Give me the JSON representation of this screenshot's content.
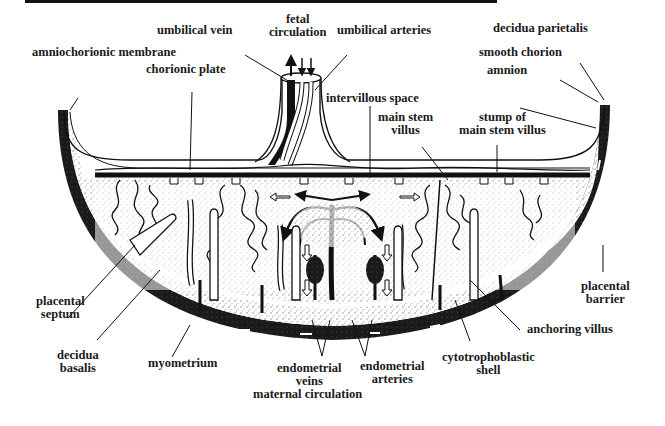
{
  "figure": {
    "colors": {
      "ink": "#111111",
      "background": "#ffffff",
      "stipple": "#8a8a8a"
    }
  },
  "labels": {
    "fetal_circulation": [
      "fetal",
      "circulation"
    ],
    "umbilical_vein": "umbilical vein",
    "umbilical_arteries": "umbilical arteries",
    "decidua_parietalis": "decidua parietalis",
    "amniochorionic_membrane": "amniochorionic membrane",
    "smooth_chorion": "smooth chorion",
    "chorionic_plate": "chorionic plate",
    "intervillous_space": "intervillous space",
    "amnion": "amnion",
    "main_stem_villus": [
      "main stem",
      "villus"
    ],
    "stump_of_main_stem_villus": [
      "stump of",
      "main stem villus"
    ],
    "placental_septum": [
      "placental",
      "septum"
    ],
    "placental_barrier": [
      "placental",
      "barrier"
    ],
    "decidua_basalis": [
      "decidua",
      "basalis"
    ],
    "myometrium": "myometrium",
    "endometrial_veins": [
      "endometrial",
      "veins"
    ],
    "maternal_circulation": "maternal circulation",
    "endometrial_arteries": [
      "endometrial",
      "arteries"
    ],
    "anchoring_villus": "anchoring villus",
    "cytotrophoblastic_shell": [
      "cytotrophoblastic",
      "shell"
    ]
  }
}
